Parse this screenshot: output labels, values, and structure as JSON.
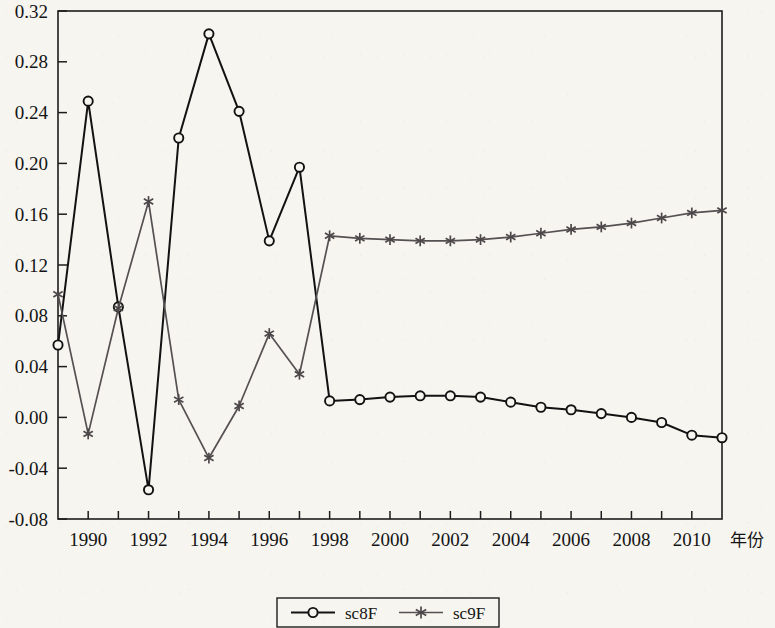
{
  "chart_data": {
    "type": "line",
    "title": "",
    "xlabel": "年份",
    "ylabel": "",
    "x": [
      1989,
      1990,
      1991,
      1992,
      1993,
      1994,
      1995,
      1996,
      1997,
      1998,
      1999,
      2000,
      2001,
      2002,
      2003,
      2004,
      2005,
      2006,
      2007,
      2008,
      2009,
      2010,
      2011
    ],
    "xlim": [
      1989,
      2011
    ],
    "ylim": [
      -0.08,
      0.32
    ],
    "ytick_values": [
      0.32,
      0.28,
      0.24,
      0.2,
      0.16,
      0.12,
      0.08,
      0.04,
      0.0,
      -0.04,
      -0.08
    ],
    "ytick_labels": [
      "0.32",
      "0.28",
      "0.24",
      "0.20",
      "0.16",
      "0.12",
      "0.08",
      "0.04",
      "0.00",
      "-0.04",
      "-0.08"
    ],
    "xtick_values": [
      1990,
      1992,
      1994,
      1996,
      1998,
      2000,
      2002,
      2004,
      2006,
      2008,
      2010
    ],
    "xtick_labels": [
      "1990",
      "1992",
      "1994",
      "1996",
      "1998",
      "2000",
      "2002",
      "2004",
      "2006",
      "2008",
      "2010"
    ],
    "xminor_values": [
      1989,
      1991,
      1993,
      1995,
      1997,
      1999,
      2001,
      2003,
      2005,
      2007,
      2009,
      2011
    ],
    "grid": false,
    "legend_position": "bottom-center",
    "series": [
      {
        "name": "sc8F",
        "color": "#121212",
        "marker": "circle",
        "values": [
          0.057,
          0.249,
          0.087,
          -0.057,
          0.22,
          0.302,
          0.241,
          0.139,
          0.197,
          0.013,
          0.014,
          0.016,
          0.017,
          0.017,
          0.016,
          0.012,
          0.008,
          0.006,
          0.003,
          0.0,
          -0.004,
          -0.014,
          -0.016
        ]
      },
      {
        "name": "sc9F",
        "color": "#555052",
        "marker": "star",
        "values": [
          0.097,
          -0.013,
          0.086,
          0.17,
          0.014,
          -0.032,
          0.009,
          0.066,
          0.034,
          0.143,
          0.141,
          0.14,
          0.139,
          0.139,
          0.14,
          0.142,
          0.145,
          0.148,
          0.15,
          0.153,
          0.157,
          0.161,
          0.163
        ]
      }
    ]
  },
  "legend": {
    "entries": [
      {
        "label": "sc8F"
      },
      {
        "label": "sc9F"
      }
    ]
  },
  "axis": {
    "x_axis_title": "年份"
  }
}
